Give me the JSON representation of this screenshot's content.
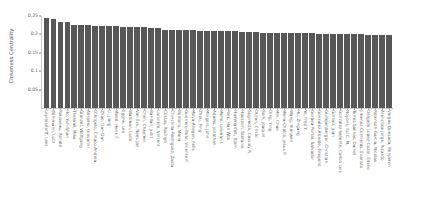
{
  "chart_data": {
    "type": "bar",
    "title": "",
    "xlabel": "",
    "ylabel": "Closeness Centrality",
    "ylim": [
      0,
      0.25
    ],
    "yticks": [
      0.05,
      0.1,
      0.15,
      0.2,
      0.25
    ],
    "ytick_labels": [
      "0.05",
      "0.1",
      "0.15",
      "0.2",
      "0.25"
    ],
    "grid": false,
    "legend": null,
    "bar_color": "#575757",
    "categories": [
      "Leydesdorff, Loet",
      "Bornmann, Lutz",
      "Rousseau, Ronald",
      "Ho, Yuh-Shan",
      "Thelwall, Mike",
      "Glanzel, Wolfgang",
      "Abramo, Giovanni",
      "D'Angelo, Ciriaco Andrea",
      "Zhao, Dan-Dan",
      "Li, Jiang",
      "Moed, Henk F.",
      "Egghe, Leo",
      "Waltman, Ludo",
      "Van Eck, Nees Jan",
      "Chen, Chaomei",
      "Bar-Ilan, Judit",
      "Larivière, Vincent",
      "Costas, Rodrigo",
      "Chinchilla-Rodriguez, Zaida",
      "Bordons, Maria",
      "Guerrero-Bote, Vicente P.",
      "Moya-Anegon, Felix",
      "Zhou, Ping",
      "Mingers, John",
      "Adams, Jonathan",
      "Meho, Lokman I.",
      "Park, Han Woo",
      "Hammarfelt, Bjorn",
      "Haustein, Stefanie",
      "Sugimoto, Cassidy R.",
      "Duran, Cristo",
      "Sorli, Joaquin",
      "Ding, Ying",
      "Min, Chao",
      "Mena-Chalco, Jesus P.",
      "Wang, Xianwen",
      "Hu, Zhigang",
      "Ye, Fred Y.",
      "Gorbea-Portal, Salvador",
      "Gonzalez-Alcaide, Gregorio",
      "Gumpenberger, Christian",
      "Gorraiz, Juan",
      "Gonzalez-Valiente, Carlos Luis",
      "Noyons, Ed C. M.",
      "Torres-Salinas, Daniel",
      "Jimenez-Contreras, Evaristo",
      "Delgado Lopez-Cozar, Emilio",
      "Robinson-Garcia, Nicolas",
      "Arencibia-Jorge, Ricardo",
      "Vargas-Quesada, Benjamin"
    ],
    "values": [
      0.2455,
      0.242,
      0.2348,
      0.233,
      0.2262,
      0.225,
      0.2248,
      0.2242,
      0.2235,
      0.223,
      0.2222,
      0.2214,
      0.2205,
      0.2198,
      0.2192,
      0.2186,
      0.2178,
      0.2132,
      0.2122,
      0.2118,
      0.2114,
      0.211,
      0.2106,
      0.2104,
      0.21,
      0.2098,
      0.2094,
      0.209,
      0.2072,
      0.206,
      0.2056,
      0.2052,
      0.2048,
      0.2044,
      0.2042,
      0.2038,
      0.2034,
      0.203,
      0.2026,
      0.2022,
      0.2018,
      0.2014,
      0.201,
      0.2006,
      0.2002,
      0.1998,
      0.1994,
      0.199,
      0.1986,
      0.1982
    ]
  }
}
